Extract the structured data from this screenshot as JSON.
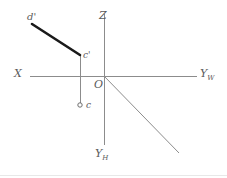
{
  "diagram": {
    "background_color": "#ffffff",
    "axis_color": "#8c8c8c",
    "segment_color": "#1a1a1a",
    "label_color": "#5a5a5a",
    "border_color": "#e0e0e0",
    "axes": [
      {
        "name": "x-axis",
        "label": "X",
        "label_x": 14,
        "label_y": 68,
        "x1": 30,
        "y1": 76,
        "x2": 197,
        "y2": 76
      },
      {
        "name": "z-axis",
        "label": "Z",
        "label_x": 99,
        "label_y": 10,
        "x1": 104,
        "y1": 14,
        "x2": 104,
        "y2": 76
      },
      {
        "name": "yw-axis",
        "label": "Y",
        "sublabel": "W",
        "label_x": 200,
        "label_y": 68,
        "x1": 104,
        "y1": 76,
        "x2": 197,
        "y2": 76
      },
      {
        "name": "yh-axis",
        "label": "Y",
        "sublabel": "H",
        "label_x": 95,
        "label_y": 148,
        "x1": 104,
        "y1": 76,
        "x2": 104,
        "y2": 145
      },
      {
        "name": "y-oblique-axis",
        "label": "",
        "sublabel": "",
        "x1": 104,
        "y1": 76,
        "x2": 179,
        "y2": 153
      }
    ],
    "origin": {
      "name": "origin",
      "label": "O",
      "x": 104,
      "y": 76,
      "label_x": 94,
      "label_y": 79
    },
    "segments": [
      {
        "name": "segment-c-prime-d-prime",
        "from": "d'",
        "to": "c'",
        "x1": 32,
        "y1": 24,
        "x2": 80,
        "y2": 55,
        "stroke_width": 2.6,
        "color": "#1a1a1a"
      },
      {
        "name": "projection-line-c",
        "from": "c'",
        "to": "c",
        "x1": 80,
        "y1": 55,
        "x2": 80,
        "y2": 103,
        "stroke_width": 1,
        "color": "#8c8c8c"
      }
    ],
    "points": [
      {
        "name": "point-d-prime",
        "label": "d'",
        "x": 32,
        "y": 24,
        "label_x": 27,
        "label_y": 12,
        "marker": "none"
      },
      {
        "name": "point-c-prime",
        "label": "c'",
        "x": 80,
        "y": 55,
        "label_x": 83,
        "label_y": 51,
        "marker": "none"
      },
      {
        "name": "point-c",
        "label": "c",
        "x": 80,
        "y": 105,
        "label_x": 86,
        "label_y": 101,
        "marker": "circle",
        "marker_radius": 2.2
      }
    ],
    "footer_rule": {
      "name": "bottom-border",
      "x1": 0,
      "y1": 175,
      "x2": 227,
      "y2": 175
    }
  }
}
